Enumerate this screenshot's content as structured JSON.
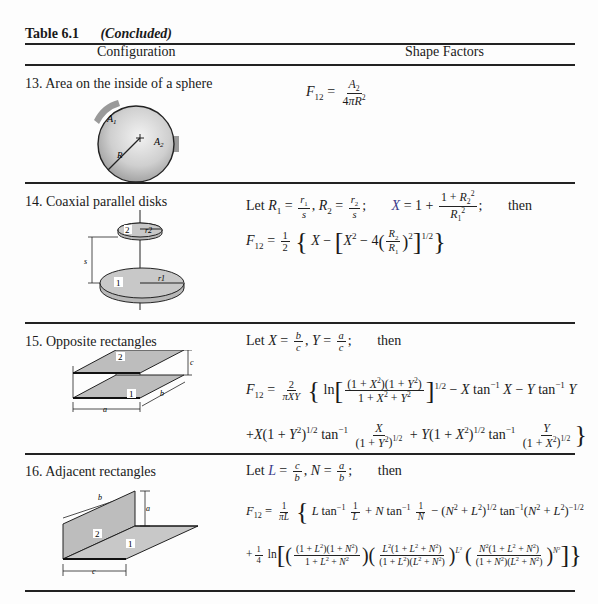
{
  "header": {
    "table_label": "Table 6.1",
    "caption": "(Concluded)"
  },
  "columns": {
    "configuration": "Configuration",
    "shape_factors": "Shape Factors"
  },
  "rows": [
    {
      "number": "13.",
      "label": "13. Area on the inside of a sphere",
      "figure": {
        "type": "sphere",
        "labels": [
          "A1",
          "A2",
          "R"
        ]
      },
      "formula": {
        "lhs": "F12",
        "text": "F12 = A2 / (4πR^2)",
        "numerator": "A",
        "numerator_sub": "2",
        "denominator": "4πR",
        "denominator_sup": "2"
      }
    },
    {
      "number": "14.",
      "label": "14. Coaxial parallel disks",
      "figure": {
        "type": "coaxial-disks",
        "labels": [
          "2",
          "r2",
          "s",
          "1",
          "r1"
        ]
      },
      "let_line": "Let R1 = r1/s, R2 = r2/s;  X = 1 + (1 + R2^2)/R1^2;  then",
      "formula": {
        "text": "F12 = 1/2 { X − [X^2 − 4(R2/R1)^2]^(1/2) }"
      },
      "words": {
        "let": "Let",
        "then": "then"
      }
    },
    {
      "number": "15.",
      "label": "15. Opposite rectangles",
      "figure": {
        "type": "opposite-rectangles",
        "labels": [
          "2",
          "1",
          "a",
          "b",
          "c"
        ]
      },
      "let_line": "Let X = b/c, Y = a/c;  then",
      "formula": {
        "line1": "F12 = 2/(πXY) { ln[ (1 + X^2)(1 + Y^2) / (1 + X^2 + Y^2) ]^(1/2) − X tan^−1 X − Y tan^−1 Y",
        "line2": "+X(1 + Y^2)^(1/2) tan^−1 X/(1 + Y^2)^(1/2) + Y(1 + X^2)^(1/2) tan^−1 Y/(1 + X^2)^(1/2) }"
      },
      "words": {
        "let": "Let",
        "then": "then"
      }
    },
    {
      "number": "16.",
      "label": "16. Adjacent rectangles",
      "figure": {
        "type": "adjacent-rectangles",
        "labels": [
          "b",
          "a",
          "2",
          "1",
          "c"
        ]
      },
      "let_line": "Let L = c/b, N = a/b;  then",
      "formula": {
        "line1": "F12 = 1/(πL) { L tan^−1 1/L + N tan^−1 1/N − (N^2 + L^2)^(1/2) tan^−1 (N^2 + L^2)^(−1/2)",
        "line2": "+ 1/4 ln[ ((1 + L^2)(1 + N^2) / (1 + L^2 + N^2)) ((L^2(1 + L^2 + N^2)) / ((1 + L^2)(L^2 + N^2)))^(L^2) ((N^2(1 + L^2 + N^2)) / ((1 + N^2)(L^2 + N^2)))^(N^2) ] }"
      },
      "words": {
        "let": "Let",
        "then": "then"
      }
    }
  ]
}
